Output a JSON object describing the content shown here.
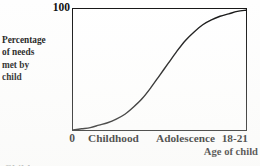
{
  "figure": {
    "kind": "line-chart-figure",
    "background_color": "#fefefe",
    "ink_color": "#111111"
  },
  "y_axis": {
    "title_lines": [
      "Percentage",
      "of needs",
      "met by",
      "child"
    ],
    "max_label": "100",
    "min_label": "0"
  },
  "x_axis": {
    "title": "Age of child",
    "stage_labels": [
      "Childhood",
      "Adolescence",
      "18-21"
    ]
  },
  "page_bleed_text": "Child",
  "chart_data": {
    "type": "line",
    "title": "",
    "subtitle": "",
    "xlabel": "Age of child",
    "ylabel": "Percentage of needs met by child",
    "xlim": [
      0,
      100
    ],
    "ylim": [
      0,
      100
    ],
    "grid": false,
    "legend": "none",
    "axis_box": "full-rectangle",
    "ytick_labels": [
      "0",
      "100"
    ],
    "ytick_values": [
      0,
      100
    ],
    "xtick_labels": [
      "0",
      "Childhood",
      "Adolescence",
      "18-21"
    ],
    "xtick_category_values": [
      0,
      22,
      62,
      95
    ],
    "annotations": [],
    "series": [
      {
        "name": "Percentage of needs met by child",
        "shape": "sigmoid / S-curve",
        "color": "#141414",
        "line_width": 1.4,
        "x": [
          0,
          5,
          10,
          15,
          20,
          25,
          30,
          35,
          40,
          45,
          50,
          55,
          60,
          65,
          70,
          75,
          80,
          85,
          90,
          95,
          100
        ],
        "values": [
          0,
          1,
          2,
          4,
          6,
          9,
          13,
          19,
          26,
          35,
          45,
          55,
          65,
          74,
          81,
          87,
          91,
          94,
          96,
          98,
          99
        ],
        "inflection_x": 52,
        "inflection_y": 50
      }
    ]
  }
}
